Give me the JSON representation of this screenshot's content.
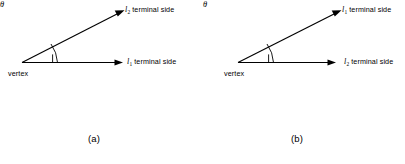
{
  "figure": {
    "background_color": "#ffffff",
    "line_color": "#000000",
    "panels": [
      {
        "caption": "(a)",
        "vertex_label": "vertex",
        "angle_symbol": "θ",
        "upper_ray": {
          "id": "l",
          "subscript": "2",
          "text": "terminal side",
          "full_label": "l2 terminal side"
        },
        "lower_ray": {
          "id": "l",
          "subscript": "1",
          "text": "terminal side",
          "full_label": "l1 terminal side"
        }
      },
      {
        "caption": "(b)",
        "vertex_label": "vertex",
        "angle_symbol": "θ",
        "upper_ray": {
          "id": "l",
          "subscript": "1",
          "text": "terminal side",
          "full_label": "l1 terminal side"
        },
        "lower_ray": {
          "id": "l",
          "subscript": "2",
          "text": "terminal side",
          "full_label": "l2 terminal side"
        }
      }
    ]
  }
}
